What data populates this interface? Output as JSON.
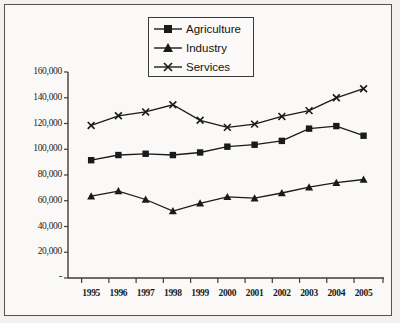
{
  "chart_data": {
    "type": "line",
    "title": "",
    "subtitle": "",
    "xlabel": "",
    "ylabel": "",
    "x": [
      "1995",
      "1996",
      "1997",
      "1998",
      "1999",
      "2000",
      "2001",
      "2002",
      "2003",
      "2004",
      "2005"
    ],
    "categories": [
      "1995",
      "1996",
      "1997",
      "1998",
      "1999",
      "2000",
      "2001",
      "2002",
      "2003",
      "2004",
      "2005"
    ],
    "ylim": [
      0,
      160000
    ],
    "ytick_values": [
      0,
      20000,
      40000,
      60000,
      80000,
      100000,
      120000,
      140000,
      160000
    ],
    "ytick_labels": [
      "-",
      "20,000",
      "40,000",
      "60,000",
      "80,000",
      "100,000",
      "120,000",
      "140,000",
      "160,000"
    ],
    "grid": false,
    "legend_position": "top-center",
    "series": [
      {
        "name": "Agriculture",
        "marker": "square",
        "color": "#1a1a1a",
        "values": [
          91500,
          95500,
          96500,
          95500,
          97500,
          102000,
          103500,
          106500,
          116000,
          118000,
          110500
        ]
      },
      {
        "name": "Industry",
        "marker": "triangle",
        "color": "#1a1a1a",
        "values": [
          63500,
          67500,
          61000,
          52000,
          58000,
          63000,
          62000,
          66000,
          70500,
          74000,
          76500
        ]
      },
      {
        "name": "Services",
        "marker": "cross",
        "color": "#1a1a1a",
        "values": [
          118500,
          126000,
          129000,
          134500,
          122500,
          117000,
          119500,
          125500,
          130000,
          140000,
          147000
        ]
      }
    ]
  },
  "legend": {
    "items": [
      {
        "label": "Agriculture",
        "marker": "square"
      },
      {
        "label": "Industry",
        "marker": "triangle"
      },
      {
        "label": "Services",
        "marker": "cross"
      }
    ]
  },
  "axes": {
    "y_labels": [
      "160,000",
      "140,000",
      "120,000",
      "100,000",
      "80,000",
      "60,000",
      "40,000",
      "20,000",
      "-"
    ],
    "x_labels": [
      "1995",
      "1996",
      "1997",
      "1998",
      "1999",
      "2000",
      "2001",
      "2002",
      "2003",
      "2004",
      "2005"
    ]
  }
}
